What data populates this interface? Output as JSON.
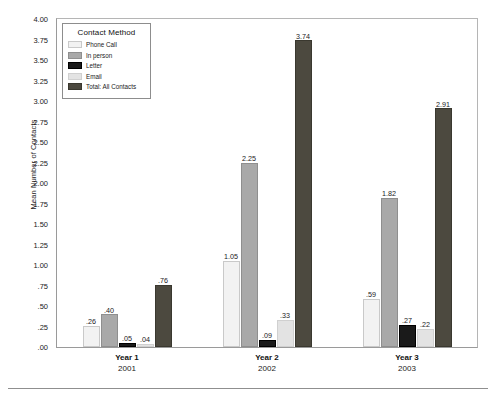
{
  "chart_data": {
    "type": "bar",
    "title": "",
    "xlabel": "",
    "ylabel": "Mean Number of Contacts",
    "ylim": [
      0.0,
      4.0
    ],
    "ytick_step": 0.25,
    "ytick_labels": [
      "4.00",
      "3.75",
      "3.50",
      "3.25",
      "3.00",
      "2.75",
      "2.50",
      "2.25",
      "2.00",
      "1.75",
      "1.50",
      "1.25",
      "1.00",
      ".75",
      ".50",
      ".25",
      ".00"
    ],
    "ytick_values": [
      4.0,
      3.75,
      3.5,
      3.25,
      3.0,
      2.75,
      2.5,
      2.25,
      2.0,
      1.75,
      1.5,
      1.25,
      1.0,
      0.75,
      0.5,
      0.25,
      0.0
    ],
    "grid": false,
    "legend_position": "upper-left-inside",
    "legend_title": "Contact Method",
    "categories": [
      "Year 1",
      "Year 2",
      "Year 3"
    ],
    "category_sublabels": [
      "2001",
      "2002",
      "2003"
    ],
    "series": [
      {
        "name": "Phone Call",
        "color": "#f2f2f2",
        "edge_color": "#c9c9c9",
        "values": [
          0.26,
          1.05,
          0.59
        ],
        "labels": [
          ".26",
          "1.05",
          ".59"
        ]
      },
      {
        "name": "In person",
        "color": "#a9a9a9",
        "edge_color": "#8f8f8f",
        "values": [
          0.4,
          2.25,
          1.82
        ],
        "labels": [
          ".40",
          "2.25",
          "1.82"
        ]
      },
      {
        "name": "Letter",
        "color": "#1a1a1a",
        "edge_color": "#000000",
        "values": [
          0.05,
          0.09,
          0.27
        ],
        "labels": [
          ".05",
          ".09",
          ".27"
        ]
      },
      {
        "name": "Email",
        "color": "#e3e3e3",
        "edge_color": "#d0d0d0",
        "values": [
          0.04,
          0.33,
          0.22
        ],
        "labels": [
          ".04",
          ".33",
          ".22"
        ]
      },
      {
        "name": "Total: All Contacts",
        "color": "#4c493f",
        "edge_color": "#3a382f",
        "values": [
          0.76,
          3.74,
          2.91
        ],
        "labels": [
          ".76",
          "3.74",
          "2.91"
        ]
      }
    ]
  },
  "figure": {
    "y_axis_title": "Mean Number of Contacts",
    "frame_color": "#9a9a9a",
    "background": "#ffffff"
  }
}
